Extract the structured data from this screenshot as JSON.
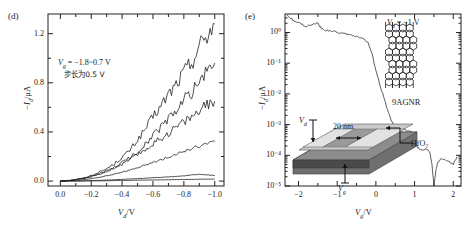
{
  "figure": {
    "panels": [
      {
        "letter": "(d)",
        "annotation_line1": "V_g = −1.8~0.7 V",
        "annotation_line2": "步长为0.5 V"
      },
      {
        "letter": "(e)",
        "annotation_vd": "V_d = −1 V",
        "ribbon_label": "9AGNR",
        "inset": {
          "label_vd": "V_d",
          "label_vg": "V_g",
          "label_length": "20 nm",
          "label_oxide": "HfO₂"
        }
      }
    ]
  },
  "chart_data": [
    {
      "id": "panel-d",
      "type": "line",
      "title": "",
      "xlabel": "V_d/V",
      "ylabel": "−I_d/μA",
      "xlim": [
        0.08,
        -1.06
      ],
      "ylim": [
        -0.04,
        1.36
      ],
      "xticks": [
        "0.0",
        "−0.2",
        "−0.4",
        "−0.6",
        "−0.8",
        "−1.0"
      ],
      "xtick_values": [
        0.0,
        -0.2,
        -0.4,
        -0.6,
        -0.8,
        -1.0
      ],
      "yticks": [
        "0.0",
        "0.4",
        "0.8",
        "1.2"
      ],
      "ytick_values": [
        0.0,
        0.4,
        0.8,
        1.2
      ],
      "grid": false,
      "legend": "none",
      "annotations": [
        "V_g = −1.8~0.7 V",
        "步长为0.5 V"
      ],
      "x": [
        0.0,
        -0.05,
        -0.1,
        -0.15,
        -0.2,
        -0.25,
        -0.3,
        -0.35,
        -0.4,
        -0.45,
        -0.5,
        -0.55,
        -0.6,
        -0.65,
        -0.7,
        -0.75,
        -0.8,
        -0.85,
        -0.9,
        -0.95,
        -1.0
      ],
      "series": [
        {
          "name": "Vg = -1.8 V",
          "values": [
            0.0,
            0.005,
            0.013,
            0.025,
            0.045,
            0.07,
            0.1,
            0.14,
            0.19,
            0.25,
            0.33,
            0.42,
            0.52,
            0.6,
            0.7,
            0.78,
            0.88,
            0.96,
            1.09,
            1.18,
            1.28
          ]
        },
        {
          "name": "Vg = -1.3 V",
          "values": [
            0.0,
            0.004,
            0.011,
            0.021,
            0.037,
            0.057,
            0.082,
            0.113,
            0.15,
            0.19,
            0.235,
            0.3,
            0.37,
            0.43,
            0.5,
            0.57,
            0.65,
            0.72,
            0.8,
            0.88,
            0.96
          ]
        },
        {
          "name": "Vg = -0.8 V",
          "values": [
            0.0,
            0.004,
            0.01,
            0.02,
            0.035,
            0.054,
            0.077,
            0.105,
            0.137,
            0.173,
            0.213,
            0.255,
            0.3,
            0.345,
            0.39,
            0.435,
            0.48,
            0.52,
            0.565,
            0.61,
            0.65
          ]
        },
        {
          "name": "Vg = -0.3 V",
          "values": [
            0.0,
            0.002,
            0.006,
            0.012,
            0.02,
            0.03,
            0.042,
            0.056,
            0.072,
            0.089,
            0.108,
            0.128,
            0.15,
            0.172,
            0.195,
            0.218,
            0.24,
            0.262,
            0.283,
            0.302,
            0.32
          ]
        },
        {
          "name": "Vg = 0.2 V",
          "values": [
            0.0,
            0.0005,
            0.001,
            0.002,
            0.004,
            0.006,
            0.008,
            0.011,
            0.014,
            0.017,
            0.02,
            0.023,
            0.027,
            0.03,
            0.034,
            0.038,
            0.042,
            0.05,
            0.055,
            0.05,
            0.045
          ]
        },
        {
          "name": "Vg = 0.7 V",
          "values": [
            0.0,
            0.0002,
            0.0005,
            0.001,
            0.0015,
            0.002,
            0.003,
            0.004,
            0.005,
            0.006,
            0.007,
            0.008,
            0.009,
            0.01,
            0.011,
            0.012,
            0.013,
            0.014,
            0.015,
            0.016,
            0.017
          ]
        }
      ]
    },
    {
      "id": "panel-e",
      "type": "line",
      "title": "",
      "xlabel": "V_g/V",
      "ylabel": "−I_d/μA",
      "xlim": [
        -2.35,
        2.2
      ],
      "ylim_log": [
        1e-05,
        4
      ],
      "xticks": [
        "−2",
        "−1",
        "0",
        "1",
        "2"
      ],
      "xtick_values": [
        -2,
        -1,
        0,
        1,
        2
      ],
      "yticks": [
        "10⁰",
        "10⁻¹",
        "10⁻²",
        "10⁻³",
        "10⁻⁴",
        "10⁻⁵"
      ],
      "ytick_values": [
        1,
        0.1,
        0.01,
        0.001,
        0.0001,
        1e-05
      ],
      "grid": false,
      "legend": "none",
      "annotations": [
        "V_d = −1 V",
        "9AGNR"
      ],
      "x": [
        -2.3,
        -2.2,
        -2.1,
        -2.0,
        -1.9,
        -1.8,
        -1.7,
        -1.6,
        -1.5,
        -1.45,
        -1.4,
        -1.3,
        -1.2,
        -1.1,
        -1.0,
        -0.9,
        -0.8,
        -0.7,
        -0.6,
        -0.5,
        -0.4,
        -0.3,
        -0.2,
        -0.1,
        0.0,
        0.1,
        0.2,
        0.3,
        0.4,
        0.5,
        0.6,
        0.7,
        0.8,
        0.9,
        1.0,
        1.05,
        1.1,
        1.2,
        1.3,
        1.4,
        1.45,
        1.5,
        1.55,
        1.6,
        1.7,
        1.8,
        1.9,
        2.0,
        2.1
      ],
      "values": [
        3.6,
        3.0,
        2.2,
        2.1,
        1.8,
        1.6,
        1.7,
        1.9,
        2.0,
        1.6,
        1.3,
        1.2,
        1.15,
        1.1,
        1.0,
        0.95,
        0.9,
        0.85,
        0.8,
        0.75,
        0.7,
        0.6,
        0.45,
        0.2,
        0.06,
        0.02,
        0.008,
        0.003,
        0.0013,
        0.0009,
        0.0008,
        0.0007,
        0.00065,
        0.0006,
        0.00032,
        0.00022,
        0.00017,
        0.00014,
        0.00016,
        0.00012,
        5e-05,
        1e-05,
        3e-05,
        6e-05,
        8e-05,
        7e-05,
        6e-05,
        5e-05,
        9e-05
      ]
    }
  ]
}
